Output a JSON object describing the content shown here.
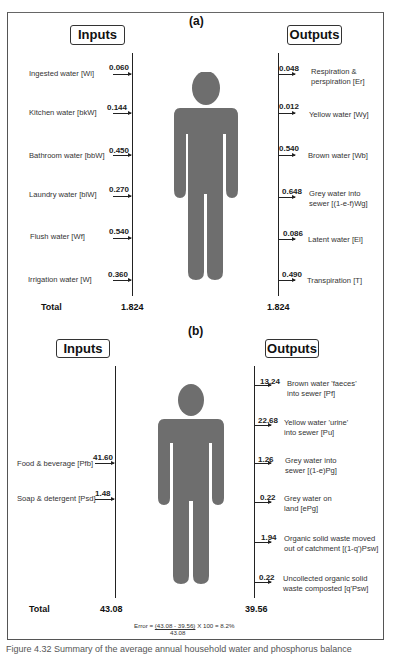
{
  "panel_a": {
    "label": "(a)",
    "inputs_title": "Inputs",
    "outputs_title": "Outputs",
    "inputs": [
      {
        "label": "Ingested water [Wi]",
        "value": "0.060"
      },
      {
        "label": "Kitchen water [bkW]",
        "value": "0.144"
      },
      {
        "label": "Bathroom water [bbW]",
        "value": "0.450"
      },
      {
        "label": "Laundry water [blW]",
        "value": "0.270"
      },
      {
        "label": "Flush water [Wf]",
        "value": "0.540"
      },
      {
        "label": "Irrigation water [W]",
        "value": "0.360"
      }
    ],
    "outputs": [
      {
        "label_line1": "Respiration &",
        "label_line2": "perspiration [Er]",
        "value": "0.048"
      },
      {
        "label_line1": "Yellow water [Wy]",
        "label_line2": "",
        "value": "0.012"
      },
      {
        "label_line1": "Brown water [Wb]",
        "label_line2": "",
        "value": "0.540"
      },
      {
        "label_line1": "Grey water into",
        "label_line2": "sewer [(1-e-f)Wg]",
        "value": "0.648"
      },
      {
        "label_line1": "Latent water [El]",
        "label_line2": "",
        "value": "0.086"
      },
      {
        "label_line1": "Transpiration [T]",
        "label_line2": "",
        "value": "0.490"
      }
    ],
    "total_label": "Total",
    "total_in": "1.824",
    "total_out": "1.824"
  },
  "panel_b": {
    "label": "(b)",
    "inputs_title": "Inputs",
    "outputs_title": "Outputs",
    "inputs": [
      {
        "label": "Food & beverage [Pfb]",
        "value": "41.60"
      },
      {
        "label": "Soap & detergent [Psd]",
        "value": "1.48"
      }
    ],
    "outputs": [
      {
        "label_line1": "Brown water 'faeces'",
        "label_line2": "into sewer [Pf]",
        "value": "13.24"
      },
      {
        "label_line1": "Yellow water 'urine'",
        "label_line2": "into sewer [Pu]",
        "value": "22.68"
      },
      {
        "label_line1": "Grey water into",
        "label_line2": "sewer [(1-e)Pg]",
        "value": "1.26"
      },
      {
        "label_line1": "Grey water on",
        "label_line2": "land [ePg]",
        "value": "0.22"
      },
      {
        "label_line1": "Organic solid waste moved",
        "label_line2": "out of catchment [(1-q')Psw]",
        "value": "1.94"
      },
      {
        "label_line1": "Uncollected organic solid",
        "label_line2": "waste composted [q'Psw]",
        "value": "0.22"
      }
    ],
    "total_label": "Total",
    "total_in": "43.08",
    "total_out": "39.56",
    "error_prefix": "Error = ",
    "error_numerator": "(43.08 - 39.56)",
    "error_suffix": " X 100 = 8.2%",
    "error_denominator": "43.08"
  },
  "caption": "Figure 4.32 Summary of the average annual household water and phosphorus balance",
  "colors": {
    "person": "#6e6e6e",
    "line": "#222222",
    "frame": "#555555"
  }
}
